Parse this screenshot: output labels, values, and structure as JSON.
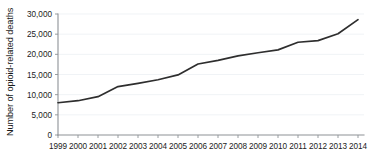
{
  "chart_data": {
    "type": "line",
    "title": "",
    "xlabel": "",
    "ylabel": "Number of opioid-related deaths",
    "categories": [
      "1999",
      "2000",
      "2001",
      "2002",
      "2003",
      "2004",
      "2005",
      "2006",
      "2007",
      "2008",
      "2009",
      "2010",
      "2011",
      "2012",
      "2013",
      "2014"
    ],
    "values": [
      8000,
      8500,
      9500,
      12000,
      12800,
      13700,
      14900,
      17600,
      18500,
      19600,
      20400,
      21100,
      23000,
      23400,
      25100,
      28600
    ],
    "series": [
      {
        "name": "Opioid-related deaths",
        "values": [
          8000,
          8500,
          9500,
          12000,
          12800,
          13700,
          14900,
          17600,
          18500,
          19600,
          20400,
          21100,
          23000,
          23400,
          25100,
          28600
        ]
      }
    ],
    "ylim": [
      0,
      30000
    ],
    "ytick_values": [
      0,
      5000,
      10000,
      15000,
      20000,
      25000,
      30000
    ],
    "ytick_labels": [
      "0",
      "5,000",
      "10,000",
      "15,000",
      "20,000",
      "25,000",
      "30,000"
    ],
    "xlim": [
      "1999",
      "2014"
    ],
    "grid": "horizontal",
    "legend": "none",
    "line_color": "#2e2e2e",
    "grid_color": "#e9eef2",
    "axis_color": "#8d9296",
    "text_color": "#1b1b1b",
    "background_color": "#ffffff"
  }
}
